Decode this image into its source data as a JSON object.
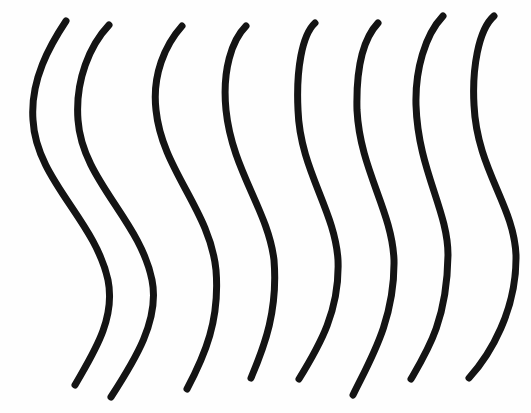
{
  "drawing": {
    "description": "Eight vertical hand-drawn wavy lines",
    "background": "#fefefe",
    "stroke_color": "#141414",
    "stroke_width": 7,
    "lines": [
      {
        "id": 1,
        "d": "M66 21 C 50 45, 30 80, 33 120 C 36 180, 95 220, 108 280 C 116 320, 92 355, 75 385"
      },
      {
        "id": 2,
        "d": "M109 25 C 90 45, 75 80, 78 120 C 82 180, 140 220, 152 280 C 160 320, 135 360, 111 397"
      },
      {
        "id": 3,
        "d": "M182 26 C 165 45, 152 75, 156 110 C 162 170, 210 210, 216 270 C 220 320, 205 355, 187 389"
      },
      {
        "id": 4,
        "d": "M246 26 C 232 40, 222 70, 226 110 C 232 170, 268 210, 274 260 C 278 310, 265 345, 251 378"
      },
      {
        "id": 5,
        "d": "M315 23 C 302 35, 296 70, 298 110 C 300 170, 335 210, 338 260 C 340 310, 320 345, 299 379"
      },
      {
        "id": 6,
        "d": "M378 23 C 362 40, 356 70, 357 110 C 360 170, 392 210, 394 260 C 395 320, 370 360, 353 395"
      },
      {
        "id": 7,
        "d": "M443 16 C 425 35, 415 70, 416 105 C 418 170, 448 210, 448 255 C 447 320, 428 350, 411 379"
      },
      {
        "id": 8,
        "d": "M494 16 C 478 30, 472 70, 474 105 C 477 170, 514 205, 516 255 C 517 310, 490 355, 469 378"
      }
    ]
  }
}
